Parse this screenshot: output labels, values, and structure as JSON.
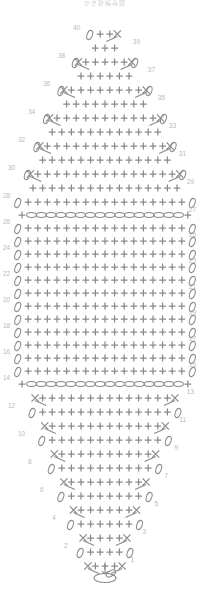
{
  "title": "かぎ針編み図",
  "colors": {
    "symbol": "#8a8a8a",
    "symbol_light": "#9a9a9a",
    "row_number": "#b9b9b9",
    "title": "#cfcfcf",
    "background": "#ffffff"
  },
  "legend": {
    "plus": "single-crochet",
    "oval": "chain-stitch",
    "x_with_legs": "decrease-increase",
    "ring": "magic-ring"
  },
  "chart_data": {
    "type": "table",
    "title": "かぎ針編み図",
    "xlabel": "",
    "ylabel": "Row",
    "grid": false,
    "legend_position": "none",
    "row_numbers_left": [
      2,
      4,
      6,
      8,
      10,
      12,
      14,
      16,
      18,
      20,
      22,
      24,
      26,
      28,
      30,
      32,
      34,
      36,
      38,
      40
    ],
    "row_numbers_right": [
      1,
      3,
      5,
      7,
      9,
      11,
      13,
      15,
      17,
      19,
      21,
      23,
      25,
      27,
      29,
      31,
      33,
      35,
      37,
      39
    ],
    "total_rows": 40,
    "max_width_stitches": 18,
    "chain_rows": [
      14,
      27
    ],
    "categories": [
      "1",
      "2",
      "3",
      "4",
      "5",
      "6",
      "7",
      "8",
      "9",
      "10",
      "11",
      "12",
      "13",
      "14",
      "15",
      "16",
      "17",
      "18",
      "19",
      "20",
      "21",
      "22",
      "23",
      "24",
      "25",
      "26",
      "27",
      "28",
      "29",
      "30",
      "31",
      "32",
      "33",
      "34",
      "35",
      "36",
      "37",
      "38",
      "39",
      "40"
    ],
    "values": [
      3,
      4,
      5,
      6,
      7,
      8,
      9,
      10,
      11,
      12,
      13,
      14,
      15,
      16,
      17,
      18,
      18,
      18,
      18,
      18,
      18,
      18,
      18,
      18,
      18,
      18,
      18,
      17,
      16,
      15,
      14,
      13,
      12,
      11,
      9,
      8,
      6,
      5,
      3,
      2
    ],
    "series": [
      {
        "name": "stitch count per row",
        "values": [
          3,
          4,
          5,
          6,
          7,
          8,
          9,
          10,
          11,
          12,
          13,
          14,
          15,
          16,
          17,
          18,
          18,
          18,
          18,
          18,
          18,
          18,
          18,
          18,
          18,
          18,
          18,
          17,
          16,
          15,
          14,
          13,
          12,
          11,
          9,
          8,
          6,
          5,
          3,
          2
        ]
      }
    ],
    "rows": [
      {
        "row": 1,
        "y": 566,
        "cx": 105,
        "plus": 3,
        "left_edge": "none",
        "right_edge": "none",
        "left_dec": true,
        "right_dec": true,
        "chain": false
      },
      {
        "row": 2,
        "y": 552,
        "cx": 105,
        "plus": 4,
        "left_edge": "oval",
        "right_edge": "oval",
        "left_dec": false,
        "right_dec": false,
        "chain": false
      },
      {
        "row": 3,
        "y": 538,
        "cx": 105,
        "plus": 4,
        "left_edge": "none",
        "right_edge": "none",
        "left_dec": true,
        "right_dec": true,
        "chain": false
      },
      {
        "row": 4,
        "y": 524,
        "cx": 105,
        "plus": 6,
        "left_edge": "oval",
        "right_edge": "oval",
        "left_dec": false,
        "right_dec": false,
        "chain": false
      },
      {
        "row": 5,
        "y": 510,
        "cx": 105,
        "plus": 6,
        "left_edge": "none",
        "right_edge": "none",
        "left_dec": true,
        "right_dec": true,
        "chain": false
      },
      {
        "row": 6,
        "y": 496,
        "cx": 105,
        "plus": 8,
        "left_edge": "oval",
        "right_edge": "oval",
        "left_dec": false,
        "right_dec": false,
        "chain": false
      },
      {
        "row": 7,
        "y": 482,
        "cx": 105,
        "plus": 8,
        "left_edge": "none",
        "right_edge": "none",
        "left_dec": true,
        "right_dec": true,
        "chain": false
      },
      {
        "row": 8,
        "y": 468,
        "cx": 105,
        "plus": 10,
        "left_edge": "oval",
        "right_edge": "oval",
        "left_dec": false,
        "right_dec": false,
        "chain": false
      },
      {
        "row": 9,
        "y": 454,
        "cx": 105,
        "plus": 10,
        "left_edge": "none",
        "right_edge": "none",
        "left_dec": true,
        "right_dec": true,
        "chain": false
      },
      {
        "row": 10,
        "y": 440,
        "cx": 105,
        "plus": 12,
        "left_edge": "oval",
        "right_edge": "oval",
        "left_dec": false,
        "right_dec": false,
        "chain": false
      },
      {
        "row": 11,
        "y": 426,
        "cx": 105,
        "plus": 12,
        "left_edge": "none",
        "right_edge": "none",
        "left_dec": true,
        "right_dec": true,
        "chain": false
      },
      {
        "row": 12,
        "y": 412,
        "cx": 105,
        "plus": 14,
        "left_edge": "oval",
        "right_edge": "oval",
        "left_dec": false,
        "right_dec": false,
        "chain": false
      },
      {
        "row": 13,
        "y": 398,
        "cx": 105,
        "plus": 14,
        "left_edge": "none",
        "right_edge": "none",
        "left_dec": true,
        "right_dec": true,
        "chain": false
      },
      {
        "row": 14,
        "y": 384,
        "cx": 105,
        "plus": 16,
        "left_edge": "none",
        "right_edge": "none",
        "left_dec": false,
        "right_dec": false,
        "chain": true
      },
      {
        "row": 15,
        "y": 371,
        "cx": 105,
        "plus": 17,
        "left_edge": "oval",
        "right_edge": "oval",
        "left_dec": false,
        "right_dec": false,
        "chain": false
      },
      {
        "row": 16,
        "y": 358,
        "cx": 105,
        "plus": 17,
        "left_edge": "oval",
        "right_edge": "oval",
        "left_dec": false,
        "right_dec": false,
        "chain": false
      },
      {
        "row": 17,
        "y": 345,
        "cx": 105,
        "plus": 17,
        "left_edge": "oval",
        "right_edge": "oval",
        "left_dec": false,
        "right_dec": false,
        "chain": false
      },
      {
        "row": 18,
        "y": 332,
        "cx": 105,
        "plus": 17,
        "left_edge": "oval",
        "right_edge": "oval",
        "left_dec": false,
        "right_dec": false,
        "chain": false
      },
      {
        "row": 19,
        "y": 319,
        "cx": 105,
        "plus": 17,
        "left_edge": "oval",
        "right_edge": "oval",
        "left_dec": false,
        "right_dec": false,
        "chain": false
      },
      {
        "row": 20,
        "y": 306,
        "cx": 105,
        "plus": 17,
        "left_edge": "oval",
        "right_edge": "oval",
        "left_dec": false,
        "right_dec": false,
        "chain": false
      },
      {
        "row": 21,
        "y": 293,
        "cx": 105,
        "plus": 17,
        "left_edge": "oval",
        "right_edge": "oval",
        "left_dec": false,
        "right_dec": false,
        "chain": false
      },
      {
        "row": 22,
        "y": 280,
        "cx": 105,
        "plus": 17,
        "left_edge": "oval",
        "right_edge": "oval",
        "left_dec": false,
        "right_dec": false,
        "chain": false
      },
      {
        "row": 23,
        "y": 267,
        "cx": 105,
        "plus": 17,
        "left_edge": "oval",
        "right_edge": "oval",
        "left_dec": false,
        "right_dec": false,
        "chain": false
      },
      {
        "row": 24,
        "y": 254,
        "cx": 105,
        "plus": 17,
        "left_edge": "oval",
        "right_edge": "oval",
        "left_dec": false,
        "right_dec": false,
        "chain": false
      },
      {
        "row": 25,
        "y": 241,
        "cx": 105,
        "plus": 17,
        "left_edge": "oval",
        "right_edge": "oval",
        "left_dec": false,
        "right_dec": false,
        "chain": false
      },
      {
        "row": 26,
        "y": 228,
        "cx": 105,
        "plus": 17,
        "left_edge": "oval",
        "right_edge": "oval",
        "left_dec": false,
        "right_dec": false,
        "chain": false
      },
      {
        "row": 27,
        "y": 215,
        "cx": 105,
        "plus": 16,
        "left_edge": "none",
        "right_edge": "none",
        "left_dec": false,
        "right_dec": false,
        "chain": true
      },
      {
        "row": 28,
        "y": 202,
        "cx": 105,
        "plus": 17,
        "left_edge": "oval",
        "right_edge": "oval",
        "left_dec": false,
        "right_dec": false,
        "chain": false
      },
      {
        "row": 29,
        "y": 188,
        "cx": 105,
        "plus": 16,
        "left_edge": "none",
        "right_edge": "none",
        "left_dec": false,
        "right_dec": false,
        "chain": false
      },
      {
        "row": 30,
        "y": 174,
        "cx": 105,
        "plus": 15,
        "left_edge": "oval",
        "right_edge": "oval",
        "left_dec": true,
        "right_dec": true,
        "chain": false
      },
      {
        "row": 31,
        "y": 160,
        "cx": 105,
        "plus": 14,
        "left_edge": "none",
        "right_edge": "none",
        "left_dec": false,
        "right_dec": false,
        "chain": false
      },
      {
        "row": 32,
        "y": 146,
        "cx": 105,
        "plus": 13,
        "left_edge": "oval",
        "right_edge": "oval",
        "left_dec": true,
        "right_dec": true,
        "chain": false
      },
      {
        "row": 33,
        "y": 132,
        "cx": 105,
        "plus": 12,
        "left_edge": "none",
        "right_edge": "none",
        "left_dec": false,
        "right_dec": false,
        "chain": false
      },
      {
        "row": 34,
        "y": 118,
        "cx": 105,
        "plus": 11,
        "left_edge": "oval",
        "right_edge": "oval",
        "left_dec": true,
        "right_dec": true,
        "chain": false
      },
      {
        "row": 35,
        "y": 104,
        "cx": 105,
        "plus": 9,
        "left_edge": "none",
        "right_edge": "none",
        "left_dec": false,
        "right_dec": false,
        "chain": false
      },
      {
        "row": 36,
        "y": 90,
        "cx": 105,
        "plus": 8,
        "left_edge": "oval",
        "right_edge": "oval",
        "left_dec": true,
        "right_dec": true,
        "chain": false
      },
      {
        "row": 37,
        "y": 76,
        "cx": 105,
        "plus": 6,
        "left_edge": "none",
        "right_edge": "none",
        "left_dec": false,
        "right_dec": false,
        "chain": false
      },
      {
        "row": 38,
        "y": 62,
        "cx": 105,
        "plus": 5,
        "left_edge": "oval",
        "right_edge": "oval",
        "left_dec": true,
        "right_dec": true,
        "chain": false
      },
      {
        "row": 39,
        "y": 48,
        "cx": 105,
        "plus": 3,
        "left_edge": "none",
        "right_edge": "none",
        "left_dec": false,
        "right_dec": false,
        "chain": false
      },
      {
        "row": 40,
        "y": 34,
        "cx": 105,
        "plus": 2,
        "left_edge": "oval",
        "right_edge": "none",
        "left_dec": false,
        "right_dec": true,
        "chain": false
      }
    ],
    "row_label_positions": [
      {
        "label": "40",
        "x": 73,
        "y": 30,
        "side": "left"
      },
      {
        "label": "39",
        "x": 140,
        "y": 44,
        "side": "right"
      },
      {
        "label": "38",
        "x": 58,
        "y": 58,
        "side": "left"
      },
      {
        "label": "37",
        "x": 155,
        "y": 72,
        "side": "right"
      },
      {
        "label": "36",
        "x": 43,
        "y": 86,
        "side": "left"
      },
      {
        "label": "35",
        "x": 165,
        "y": 100,
        "side": "right"
      },
      {
        "label": "34",
        "x": 28,
        "y": 114,
        "side": "left"
      },
      {
        "label": "33",
        "x": 176,
        "y": 128,
        "side": "right"
      },
      {
        "label": "32",
        "x": 18,
        "y": 142,
        "side": "left"
      },
      {
        "label": "31",
        "x": 186,
        "y": 156,
        "side": "right"
      },
      {
        "label": "30",
        "x": 8,
        "y": 170,
        "side": "left"
      },
      {
        "label": "29",
        "x": 194,
        "y": 184,
        "side": "right"
      },
      {
        "label": "28",
        "x": 3,
        "y": 198,
        "side": "left"
      },
      {
        "label": "27",
        "x": 196,
        "y": 212,
        "side": "right"
      },
      {
        "label": "26",
        "x": 3,
        "y": 224,
        "side": "left"
      },
      {
        "label": "25",
        "x": 196,
        "y": 237,
        "side": "right"
      },
      {
        "label": "24",
        "x": 3,
        "y": 250,
        "side": "left"
      },
      {
        "label": "23",
        "x": 196,
        "y": 263,
        "side": "right"
      },
      {
        "label": "22",
        "x": 3,
        "y": 276,
        "side": "left"
      },
      {
        "label": "21",
        "x": 196,
        "y": 289,
        "side": "right"
      },
      {
        "label": "20",
        "x": 3,
        "y": 302,
        "side": "left"
      },
      {
        "label": "19",
        "x": 196,
        "y": 315,
        "side": "right"
      },
      {
        "label": "18",
        "x": 3,
        "y": 328,
        "side": "left"
      },
      {
        "label": "17",
        "x": 196,
        "y": 341,
        "side": "right"
      },
      {
        "label": "16",
        "x": 3,
        "y": 354,
        "side": "left"
      },
      {
        "label": "15",
        "x": 196,
        "y": 367,
        "side": "right"
      },
      {
        "label": "14",
        "x": 3,
        "y": 380,
        "side": "left"
      },
      {
        "label": "13",
        "x": 194,
        "y": 394,
        "side": "right"
      },
      {
        "label": "12",
        "x": 8,
        "y": 408,
        "side": "left"
      },
      {
        "label": "11",
        "x": 186,
        "y": 422,
        "side": "right"
      },
      {
        "label": "10",
        "x": 18,
        "y": 436,
        "side": "left"
      },
      {
        "label": "9",
        "x": 178,
        "y": 450,
        "side": "right"
      },
      {
        "label": "8",
        "x": 28,
        "y": 464,
        "side": "left"
      },
      {
        "label": "7",
        "x": 168,
        "y": 478,
        "side": "right"
      },
      {
        "label": "6",
        "x": 40,
        "y": 492,
        "side": "left"
      },
      {
        "label": "5",
        "x": 158,
        "y": 506,
        "side": "right"
      },
      {
        "label": "4",
        "x": 52,
        "y": 520,
        "side": "left"
      },
      {
        "label": "3",
        "x": 146,
        "y": 534,
        "side": "right"
      },
      {
        "label": "2",
        "x": 64,
        "y": 548,
        "side": "left"
      },
      {
        "label": "1",
        "x": 134,
        "y": 562,
        "side": "right"
      }
    ],
    "magic_ring": {
      "cx": 105,
      "cy": 578,
      "rx": 11,
      "ry": 4.5
    }
  }
}
